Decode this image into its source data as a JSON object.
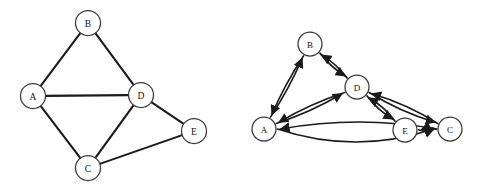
{
  "figure": {
    "background_color": "#fefefe",
    "stroke_color": "#1b1b1b",
    "node_fill": "#ffffff",
    "node_stroke": "#3a3a3a"
  },
  "graphs": [
    {
      "id": "undirected-graph",
      "kind": "undirected",
      "node_radius": 12.5,
      "nodes": [
        {
          "id": "A",
          "label": "A",
          "x": 33,
          "y": 96
        },
        {
          "id": "B",
          "label": "B",
          "x": 88,
          "y": 23
        },
        {
          "id": "C",
          "label": "C",
          "x": 88,
          "y": 168
        },
        {
          "id": "D",
          "label": "D",
          "x": 141,
          "y": 95
        },
        {
          "id": "E",
          "label": "E",
          "x": 194,
          "y": 131
        }
      ],
      "edges": [
        {
          "from": "A",
          "to": "B"
        },
        {
          "from": "B",
          "to": "D"
        },
        {
          "from": "A",
          "to": "D"
        },
        {
          "from": "A",
          "to": "C"
        },
        {
          "from": "C",
          "to": "D"
        },
        {
          "from": "D",
          "to": "E"
        },
        {
          "from": "C",
          "to": "E"
        }
      ]
    },
    {
      "id": "directed-graph",
      "kind": "directed",
      "node_radius": 12.0,
      "nodes": [
        {
          "id": "A",
          "label": "A",
          "x": 264,
          "y": 129
        },
        {
          "id": "B",
          "label": "B",
          "x": 310,
          "y": 44
        },
        {
          "id": "C",
          "label": "C",
          "x": 450,
          "y": 129
        },
        {
          "id": "D",
          "label": "D",
          "x": 357,
          "y": 87
        },
        {
          "id": "E",
          "label": "E",
          "x": 405,
          "y": 130
        }
      ],
      "edges": [
        {
          "from": "A",
          "to": "B",
          "curve": 3
        },
        {
          "from": "B",
          "to": "A",
          "curve": 3
        },
        {
          "from": "B",
          "to": "D",
          "curve": 3
        },
        {
          "from": "D",
          "to": "B",
          "curve": 3
        },
        {
          "from": "A",
          "to": "D",
          "curve": 4
        },
        {
          "from": "D",
          "to": "A",
          "curve": 4
        },
        {
          "from": "D",
          "to": "E",
          "curve": 3.5
        },
        {
          "from": "E",
          "to": "D",
          "curve": 3.5
        },
        {
          "from": "D",
          "to": "C",
          "curve": 5
        },
        {
          "from": "C",
          "to": "D",
          "curve": 5
        },
        {
          "from": "E",
          "to": "C",
          "curve": 3
        },
        {
          "from": "C",
          "to": "E",
          "curve": 3
        },
        {
          "from": "A",
          "to": "C",
          "curve": 26
        },
        {
          "from": "C",
          "to": "A",
          "curve": 14
        }
      ]
    }
  ]
}
